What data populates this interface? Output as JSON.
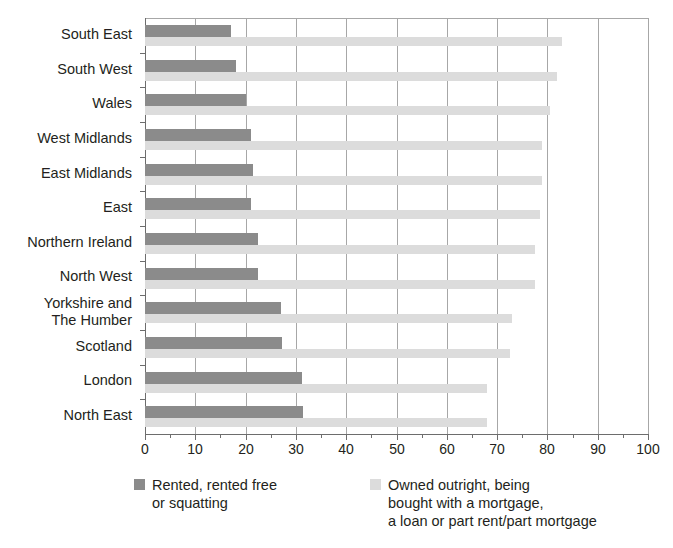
{
  "chart_data": {
    "type": "bar",
    "orientation": "horizontal",
    "grouped": true,
    "title": "",
    "subtitle": "",
    "xlabel": "",
    "ylabel": "",
    "xlim": [
      0,
      100
    ],
    "xticks": [
      0,
      10,
      20,
      30,
      40,
      50,
      60,
      70,
      80,
      90,
      100
    ],
    "xtick_labels": [
      "0",
      "10",
      "20",
      "30",
      "40",
      "50",
      "60",
      "70",
      "80",
      "90",
      "100"
    ],
    "grid": "vertical",
    "legend_position": "bottom",
    "categories": [
      "South East",
      "South West",
      "Wales",
      "West Midlands",
      "East Midlands",
      "East",
      "Northern Ireland",
      "North West",
      "Yorkshire and\nThe Humber",
      "Scotland",
      "London",
      "North East"
    ],
    "series": [
      {
        "name": "Rented, rented free\nor squatting",
        "color": "#8b8b8b",
        "values": [
          17,
          18,
          20,
          21,
          21.5,
          21,
          22.5,
          22.5,
          27,
          27.3,
          31.3,
          31.5
        ]
      },
      {
        "name": "Owned outright, being\nbought with a mortgage,\na loan or part rent/part mortgage",
        "color": "#dcdcdc",
        "values": [
          83,
          82,
          80.5,
          79,
          79,
          78.5,
          77.5,
          77.5,
          73,
          72.5,
          68,
          68
        ]
      }
    ]
  },
  "legend": {
    "entries": [
      {
        "label": "Rented, rented free\nor squatting",
        "swatch_color": "#8b8b8b",
        "swatch_name": "dark-gray-swatch"
      },
      {
        "label": "Owned outright, being\nbought with a mortgage,\na loan or part rent/part mortgage",
        "swatch_color": "#dcdcdc",
        "swatch_name": "light-gray-swatch"
      }
    ]
  },
  "axis": {
    "zero_color": "#6d6d6d",
    "gridline_color": "#a7a7a7"
  }
}
